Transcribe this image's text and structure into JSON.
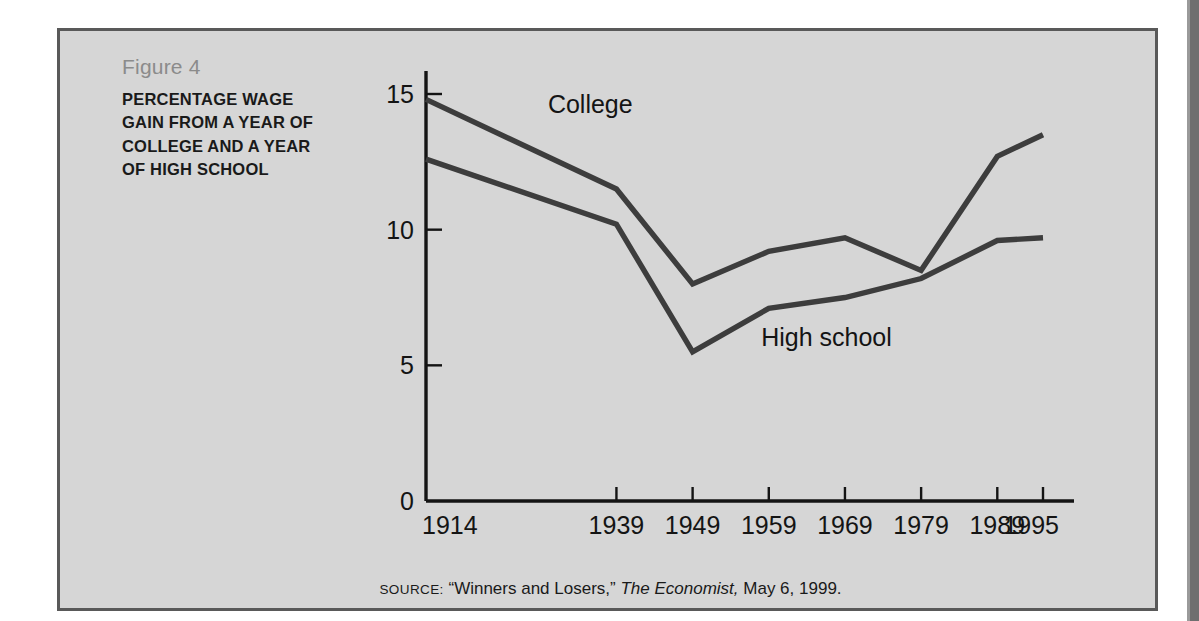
{
  "figure": {
    "number_label": "Figure 4",
    "title": "PERCENTAGE WAGE GAIN FROM A YEAR OF COLLEGE AND A YEAR OF HIGH SCHOOL"
  },
  "source": {
    "kicker": "SOURCE:",
    "quoted_article": "“Winners and Losers,”",
    "publication": "The Economist,",
    "date": "May 6, 1999."
  },
  "colors": {
    "panel_background": "#d6d6d6",
    "panel_border": "#595959",
    "line": "#3d3d3d",
    "axis": "#141414",
    "figure_number_text": "#8b8b8b",
    "title_text": "#1a1a1a"
  },
  "chart_data": {
    "type": "line",
    "title": "PERCENTAGE WAGE GAIN FROM A YEAR OF COLLEGE AND A YEAR OF HIGH SCHOOL",
    "xlabel": "",
    "ylabel": "",
    "x": [
      1914,
      1939,
      1949,
      1959,
      1969,
      1979,
      1989,
      1995
    ],
    "categories": [
      "1914",
      "1939",
      "1949",
      "1959",
      "1969",
      "1979",
      "1989",
      "1995"
    ],
    "xtick_labels": [
      "1914",
      "1939",
      "1949",
      "1959",
      "1969",
      "1979",
      "1989",
      "1995"
    ],
    "ytick_labels": [
      "0",
      "5",
      "10",
      "15"
    ],
    "yticks": [
      0,
      5,
      10,
      15
    ],
    "ylim": [
      0,
      16.2
    ],
    "xlim": [
      1914,
      1995
    ],
    "grid": false,
    "legend": "inline-labels",
    "series": [
      {
        "name": "College",
        "label": "College",
        "values": [
          14.8,
          11.5,
          8.0,
          9.2,
          9.7,
          8.5,
          12.7,
          13.5
        ]
      },
      {
        "name": "High school",
        "label": "High school",
        "values": [
          12.6,
          10.2,
          5.5,
          7.1,
          7.5,
          8.2,
          9.6,
          9.7
        ]
      }
    ],
    "annotations": [
      {
        "text": "College",
        "x": 1930,
        "y": 14.3
      },
      {
        "text": "High school",
        "x": 1958,
        "y": 5.7
      }
    ]
  }
}
